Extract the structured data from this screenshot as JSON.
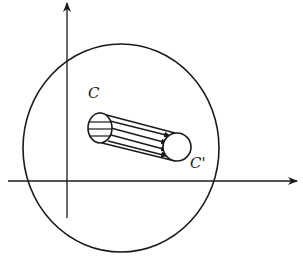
{
  "figure": {
    "stroke_color": "#1a1a1a",
    "background": "#ffffff"
  },
  "labels": {
    "source_section": "C",
    "target_section": "C'"
  },
  "axes": {
    "horizontal": {
      "x1": 8,
      "y": 181,
      "x2": 297
    },
    "vertical": {
      "x": 67,
      "y1": 218,
      "y2": 3
    }
  },
  "region": {
    "cx": 121,
    "cy": 148,
    "rx": 98,
    "ry": 104
  },
  "section_c": {
    "cx": 100,
    "cy": 128,
    "rx": 12,
    "ry": 15
  },
  "section_c_prime": {
    "cx": 177,
    "cy": 147,
    "r": 14
  }
}
